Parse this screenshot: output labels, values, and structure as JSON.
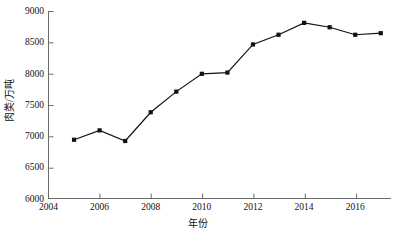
{
  "chart_data": {
    "type": "line",
    "title": "",
    "subtitle": "",
    "xlabel": "年份",
    "ylabel": "肉类/万吨",
    "x": [
      2005,
      2006,
      2007,
      2008,
      2009,
      2010,
      2011,
      2012,
      2013,
      2014,
      2015,
      2016,
      2017
    ],
    "values": [
      6940,
      7090,
      6920,
      7380,
      7710,
      7995,
      8015,
      8465,
      8620,
      8810,
      8740,
      8620,
      8645
    ],
    "series": [
      {
        "name": "肉类产量",
        "values": [
          6940,
          7090,
          6920,
          7380,
          7710,
          7995,
          8015,
          8465,
          8620,
          8810,
          8740,
          8620,
          8645
        ]
      }
    ],
    "xlim": [
      2004,
      2017.4
    ],
    "ylim": [
      6000,
      9000
    ],
    "xticks": [
      2004,
      2006,
      2008,
      2010,
      2012,
      2014,
      2016
    ],
    "xtick_labels": [
      "2004",
      "2006",
      "2008",
      "2010",
      "2012",
      "2014",
      "2016"
    ],
    "yticks": [
      6000,
      6500,
      7000,
      7500,
      8000,
      8500,
      9000
    ],
    "ytick_labels": [
      "6000",
      "6500",
      "7000",
      "7500",
      "8000",
      "8500",
      "9000"
    ],
    "grid": false,
    "legend": null,
    "legend_position": "none",
    "annotations": [],
    "marker": "square",
    "marker_color": "#111111",
    "line_color": "#111111",
    "line_width": 1.2,
    "background_color": "#ffffff",
    "axis_color": "#6b6b6b"
  }
}
